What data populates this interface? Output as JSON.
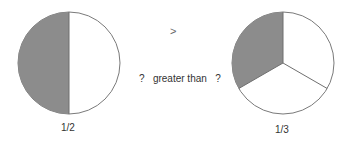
{
  "left_pie": {
    "label": "1/2",
    "fraction_shaded": "1/2",
    "fill": "#8c8c8c"
  },
  "right_pie": {
    "label": "1/3",
    "fraction_shaded": "1/3",
    "fill": "#8c8c8c"
  },
  "comparison": {
    "symbol": ">",
    "text": "?   greater than   ?"
  },
  "colors": {
    "stroke": "#7a7a7a",
    "shade": "#8c8c8c",
    "text": "#333333"
  }
}
